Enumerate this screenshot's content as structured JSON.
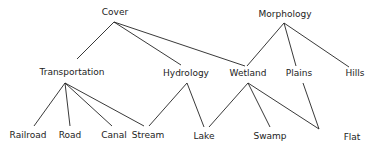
{
  "diagram": {
    "type": "hierarchy",
    "nodes": [
      {
        "id": "cover",
        "label": "Cover",
        "x": 115,
        "y": 15
      },
      {
        "id": "morphology",
        "label": "Morphology",
        "x": 285,
        "y": 17
      },
      {
        "id": "transportation",
        "label": "Transportation",
        "x": 72,
        "y": 75
      },
      {
        "id": "hydrology",
        "label": "Hydrology",
        "x": 186,
        "y": 76
      },
      {
        "id": "wetland",
        "label": "Wetland",
        "x": 248,
        "y": 76
      },
      {
        "id": "plains",
        "label": "Plains",
        "x": 299,
        "y": 76
      },
      {
        "id": "hills",
        "label": "Hills",
        "x": 355,
        "y": 76
      },
      {
        "id": "railroad",
        "label": "Railroad",
        "x": 28,
        "y": 138
      },
      {
        "id": "road",
        "label": "Road",
        "x": 70,
        "y": 138
      },
      {
        "id": "canal",
        "label": "Canal",
        "x": 114,
        "y": 138
      },
      {
        "id": "stream",
        "label": "Stream",
        "x": 148,
        "y": 138
      },
      {
        "id": "lake",
        "label": "Lake",
        "x": 204,
        "y": 139
      },
      {
        "id": "swamp",
        "label": "Swamp",
        "x": 270,
        "y": 139
      },
      {
        "id": "flat",
        "label": "Flat",
        "x": 352,
        "y": 140
      }
    ],
    "edges": [
      {
        "from": "cover",
        "to": "transportation",
        "x1": 114,
        "y1": 22,
        "x2": 77,
        "y2": 59
      },
      {
        "from": "cover",
        "to": "hydrology",
        "x1": 114,
        "y1": 22,
        "x2": 181,
        "y2": 65
      },
      {
        "from": "cover",
        "to": "wetland",
        "x1": 114,
        "y1": 22,
        "x2": 245,
        "y2": 66
      },
      {
        "from": "morphology",
        "to": "wetland",
        "x1": 284,
        "y1": 23,
        "x2": 247,
        "y2": 66
      },
      {
        "from": "morphology",
        "to": "plains",
        "x1": 284,
        "y1": 23,
        "x2": 296,
        "y2": 66
      },
      {
        "from": "morphology",
        "to": "hills",
        "x1": 284,
        "y1": 23,
        "x2": 349,
        "y2": 67
      },
      {
        "from": "transportation",
        "to": "railroad",
        "x1": 65,
        "y1": 83,
        "x2": 34,
        "y2": 126
      },
      {
        "from": "transportation",
        "to": "road",
        "x1": 65,
        "y1": 83,
        "x2": 70,
        "y2": 126
      },
      {
        "from": "transportation",
        "to": "canal",
        "x1": 65,
        "y1": 83,
        "x2": 112,
        "y2": 126
      },
      {
        "from": "transportation",
        "to": "stream",
        "x1": 65,
        "y1": 83,
        "x2": 144,
        "y2": 126
      },
      {
        "from": "hydrology",
        "to": "stream",
        "x1": 187,
        "y1": 83,
        "x2": 149,
        "y2": 126
      },
      {
        "from": "hydrology",
        "to": "lake",
        "x1": 187,
        "y1": 83,
        "x2": 204,
        "y2": 127
      },
      {
        "from": "wetland",
        "to": "lake",
        "x1": 248,
        "y1": 83,
        "x2": 209,
        "y2": 127
      },
      {
        "from": "wetland",
        "to": "swamp",
        "x1": 248,
        "y1": 83,
        "x2": 270,
        "y2": 127
      },
      {
        "from": "wetland",
        "to": "flat",
        "x1": 248,
        "y1": 83,
        "x2": 319,
        "y2": 129
      },
      {
        "from": "plains",
        "to": "flat",
        "x1": 303,
        "y1": 83,
        "x2": 319,
        "y2": 129
      }
    ]
  }
}
